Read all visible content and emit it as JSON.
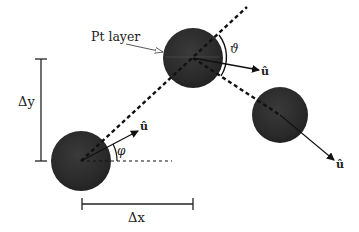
{
  "diagram": {
    "annotation": {
      "pt_layer": "Pt layer"
    },
    "labels": {
      "delta_x": "Δx",
      "delta_y": "Δy",
      "phi": "φ",
      "theta": "ϑ",
      "u_hat_1": "û",
      "u_hat_2": "û",
      "u_hat_3": "û"
    },
    "spheres": [
      {
        "id": "sphere-1",
        "cx": 81,
        "cy": 161,
        "r": 30
      },
      {
        "id": "sphere-2",
        "cx": 193,
        "cy": 58,
        "r": 30
      },
      {
        "id": "sphere-3",
        "cx": 280,
        "cy": 115,
        "r": 28
      }
    ],
    "colors": {
      "sphere": "#2b2b2b",
      "line": "#111111",
      "background": "#ffffff"
    }
  }
}
